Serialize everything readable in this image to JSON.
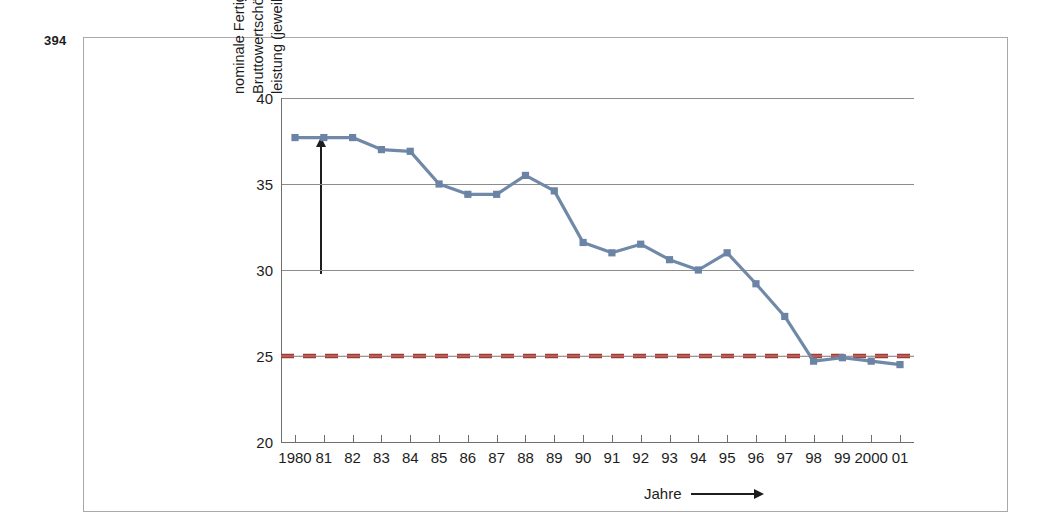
{
  "page": {
    "number": "394"
  },
  "axis_titles": {
    "y_lines": [
      "nominale Fertigungstiefe: Anteil der",
      "Bruttowertschöpfung an der Gesamt-",
      "leistung (jeweils nominal)"
    ],
    "x_label": "Jahre"
  },
  "colors": {
    "series_line": "#7089a8",
    "series_marker": "#6b84a5",
    "reference_line": "#a63a33",
    "gridline": "#8c8c8c",
    "axis": "#6f6f6f",
    "frame": "#a9a9a9",
    "text": "#1d1d1d"
  },
  "chart_data": {
    "type": "line",
    "title": "",
    "xlabel": "Jahre",
    "ylabel": "nominale Fertigungstiefe: Anteil der Bruttowertschöpfung an der Gesamtleistung (jeweils nominal)",
    "categories": [
      "1980",
      "81",
      "82",
      "83",
      "84",
      "85",
      "86",
      "87",
      "88",
      "89",
      "90",
      "91",
      "92",
      "93",
      "94",
      "95",
      "96",
      "97",
      "98",
      "99",
      "2000",
      "01"
    ],
    "x_tick_labels": [
      "1980",
      "81",
      "82",
      "83",
      "84",
      "85",
      "86",
      "87",
      "88",
      "89",
      "90",
      "91",
      "92",
      "93",
      "94",
      "95",
      "96",
      "97",
      "98",
      "99",
      "2000",
      "01"
    ],
    "y_tick_labels": [
      "20",
      "25",
      "30",
      "35",
      "40"
    ],
    "y_ticks": [
      20,
      25,
      30,
      35,
      40
    ],
    "ylim": [
      20,
      40
    ],
    "grid": true,
    "legend": "none",
    "series": [
      {
        "name": "nominale Fertigungstiefe",
        "style": "line-marker",
        "color": "#7089a8",
        "values": [
          37.7,
          37.7,
          37.7,
          37.0,
          36.9,
          35.0,
          34.4,
          34.4,
          35.5,
          34.6,
          31.6,
          31.0,
          31.5,
          30.6,
          30.0,
          31.0,
          29.2,
          27.3,
          24.7,
          24.9,
          24.7,
          24.5
        ]
      },
      {
        "name": "Referenzlinie 25",
        "style": "dashed",
        "color": "#a63a33",
        "constant_value": 25
      }
    ]
  }
}
